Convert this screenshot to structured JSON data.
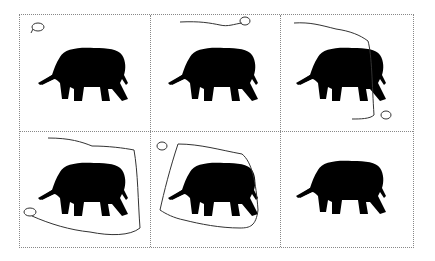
{
  "figure": {
    "rows": 2,
    "cols": 3,
    "panels": [
      {
        "id": 1,
        "stage": "initial point"
      },
      {
        "id": 2,
        "stage": "contour growing along top"
      },
      {
        "id": 3,
        "stage": "contour extends down right side"
      },
      {
        "id": 4,
        "stage": "contour nearly encloses elephant"
      },
      {
        "id": 5,
        "stage": "closed contour around elephant"
      },
      {
        "id": 6,
        "stage": "segmented elephant result"
      }
    ],
    "colors": {
      "silhouette": "#000000",
      "contour": "#333333",
      "grid": "#888888",
      "background": "#ffffff"
    }
  }
}
